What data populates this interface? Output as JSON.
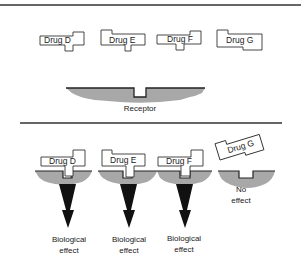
{
  "figure": {
    "type": "receptor-binding-schematic",
    "colors": {
      "line": "#333333",
      "receptor_fill": "#a8a8a8",
      "arrow": "#111111",
      "drug_fill": "#ffffff"
    },
    "top_panel": {
      "drugs": [
        {
          "label": "Drug D"
        },
        {
          "label": "Drug E"
        },
        {
          "label": "Drug F"
        },
        {
          "label": "Drug G"
        }
      ],
      "receptor_label": "Receptor"
    },
    "bottom_panel": {
      "bindings": [
        {
          "drug": "Drug D",
          "outcome_line1": "Biological",
          "outcome_line2": "effect",
          "binds": true
        },
        {
          "drug": "Drug E",
          "outcome_line1": "Biological",
          "outcome_line2": "effect",
          "binds": true
        },
        {
          "drug": "Drug F",
          "outcome_line1": "Biological",
          "outcome_line2": "effect",
          "binds": true
        },
        {
          "drug": "Drug G",
          "outcome_line1": "No",
          "outcome_line2": "effect",
          "binds": false
        }
      ]
    }
  }
}
